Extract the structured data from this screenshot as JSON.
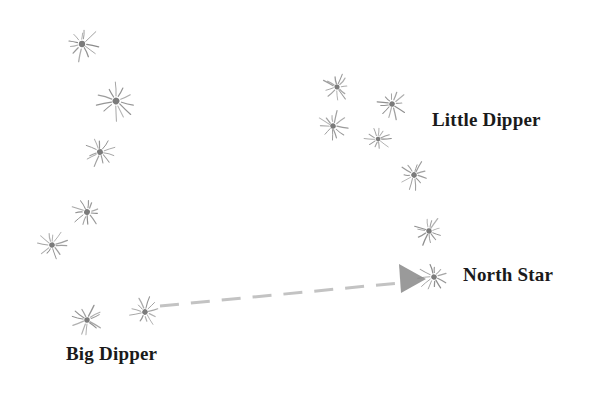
{
  "diagram": {
    "background_color": "#ffffff",
    "width": 591,
    "height": 396,
    "star_color": "#8a8a8a",
    "star_core_color": "#7b7b7b",
    "label_color": "#1a1a1a",
    "pointer_color": "#c3c3c3",
    "arrowhead_color": "#9a9a9a"
  },
  "labels": {
    "little_dipper": "Little Dipper",
    "north_star": "North Star",
    "big_dipper": "Big Dipper"
  },
  "constellations": [
    {
      "name": "Big Dipper",
      "label_position": {
        "x": 66,
        "y": 344
      },
      "stars": [
        {
          "id": "bd-1",
          "x": 82,
          "y": 44,
          "size": 15
        },
        {
          "id": "bd-2",
          "x": 116,
          "y": 101,
          "size": 16
        },
        {
          "id": "bd-3",
          "x": 100,
          "y": 152,
          "size": 14
        },
        {
          "id": "bd-4",
          "x": 87,
          "y": 212,
          "size": 14
        },
        {
          "id": "bd-5",
          "x": 52,
          "y": 245,
          "size": 13
        },
        {
          "id": "bd-6",
          "x": 87,
          "y": 320,
          "size": 13
        },
        {
          "id": "bd-7",
          "x": 145,
          "y": 312,
          "size": 13
        }
      ]
    },
    {
      "name": "Little Dipper",
      "label_position": {
        "x": 432,
        "y": 110
      },
      "stars": [
        {
          "id": "ld-1",
          "x": 337,
          "y": 87,
          "size": 12
        },
        {
          "id": "ld-2",
          "x": 392,
          "y": 104,
          "size": 13
        },
        {
          "id": "ld-3",
          "x": 333,
          "y": 126,
          "size": 13
        },
        {
          "id": "ld-4",
          "x": 378,
          "y": 139,
          "size": 11
        },
        {
          "id": "ld-5",
          "x": 414,
          "y": 175,
          "size": 13
        },
        {
          "id": "ld-6",
          "x": 429,
          "y": 231,
          "size": 13
        }
      ]
    },
    {
      "name": "North Star",
      "label_position": {
        "x": 463,
        "y": 265
      },
      "stars": [
        {
          "id": "ns-1",
          "x": 434,
          "y": 277,
          "size": 13
        }
      ]
    }
  ],
  "pointer_line": {
    "from": {
      "x": 160,
      "y": 306
    },
    "to": {
      "x": 399,
      "y": 283
    },
    "style": "dashed",
    "dash_pattern": "19 12",
    "stroke_width": 3,
    "arrowhead": {
      "tip": {
        "x": 426,
        "y": 279
      },
      "back_top": {
        "x": 399,
        "y": 264
      },
      "back_bottom": {
        "x": 401,
        "y": 293
      }
    }
  }
}
